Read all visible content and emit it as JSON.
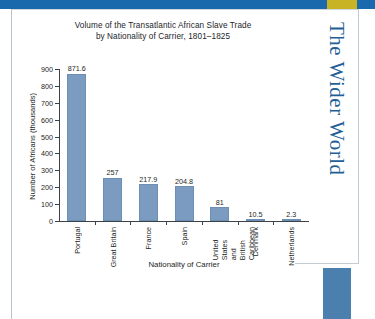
{
  "page": {
    "section_rail_text": "The Wider World",
    "accent_colors": {
      "header_blue": "#1b69ad",
      "header_gold": "#c8b324",
      "rail_text_blue": "#1f5f96",
      "corner_block_blue": "#4a7fae",
      "bar_fill": "#7b9cc0"
    }
  },
  "chart_data": {
    "type": "bar",
    "title": "Volume of the Transatlantic  African Slave Trade\nby Nationality of Carrier, 1801–1825",
    "title_line1": "Volume of the Transatlantic  African Slave Trade",
    "title_line2": "by Nationality of Carrier, 1801–1825",
    "xlabel": "Nationality of Carrier",
    "ylabel": "Number of Africans (thousands)",
    "ylim": [
      0,
      900
    ],
    "yticks": [
      0,
      100,
      200,
      300,
      400,
      500,
      600,
      700,
      800,
      900
    ],
    "ytick_labels": [
      "0",
      "100",
      "200",
      "300",
      "400",
      "500",
      "600",
      "700",
      "800",
      "900"
    ],
    "grid": false,
    "legend": null,
    "categories": [
      "Portugal",
      "Great Britain",
      "France",
      "Spain",
      "United States and\nBritish Caribbean",
      "Denmark",
      "Netherlands"
    ],
    "values": [
      871.6,
      257,
      217.9,
      204.8,
      81,
      10.5,
      2.3
    ],
    "value_labels": [
      "871.6",
      "257",
      "217.9",
      "204.8",
      "81",
      "10.5",
      "2.3"
    ]
  }
}
